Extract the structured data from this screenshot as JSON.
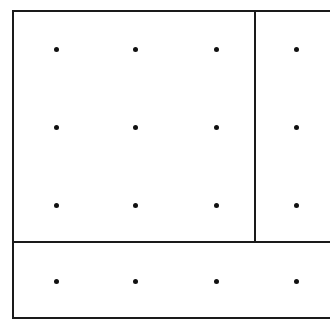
{
  "diagram": {
    "colors": {
      "line": "#1a1a1a",
      "dot": "#111111",
      "background": "#ffffff"
    },
    "dot_columns_x": [
      56,
      135,
      216,
      296
    ],
    "dot_rows_y": [
      49,
      127,
      205,
      281
    ],
    "lines": [
      {
        "id": "top-edge",
        "x1": 13,
        "y1": 11,
        "x2": 330,
        "y2": 11
      },
      {
        "id": "left-edge",
        "x1": 13,
        "y1": 11,
        "x2": 13,
        "y2": 318
      },
      {
        "id": "bottom-edge",
        "x1": 13,
        "y1": 318,
        "x2": 330,
        "y2": 318
      },
      {
        "id": "vertical-divider",
        "x1": 255,
        "y1": 11,
        "x2": 255,
        "y2": 242
      },
      {
        "id": "horizontal-divider",
        "x1": 13,
        "y1": 242,
        "x2": 330,
        "y2": 242
      }
    ],
    "regions": [
      {
        "id": "main-block",
        "rows": 3,
        "cols": 3
      },
      {
        "id": "right-strip",
        "rows": 3,
        "cols": 1
      },
      {
        "id": "bottom-strip",
        "rows": 1,
        "cols": 4
      }
    ]
  }
}
